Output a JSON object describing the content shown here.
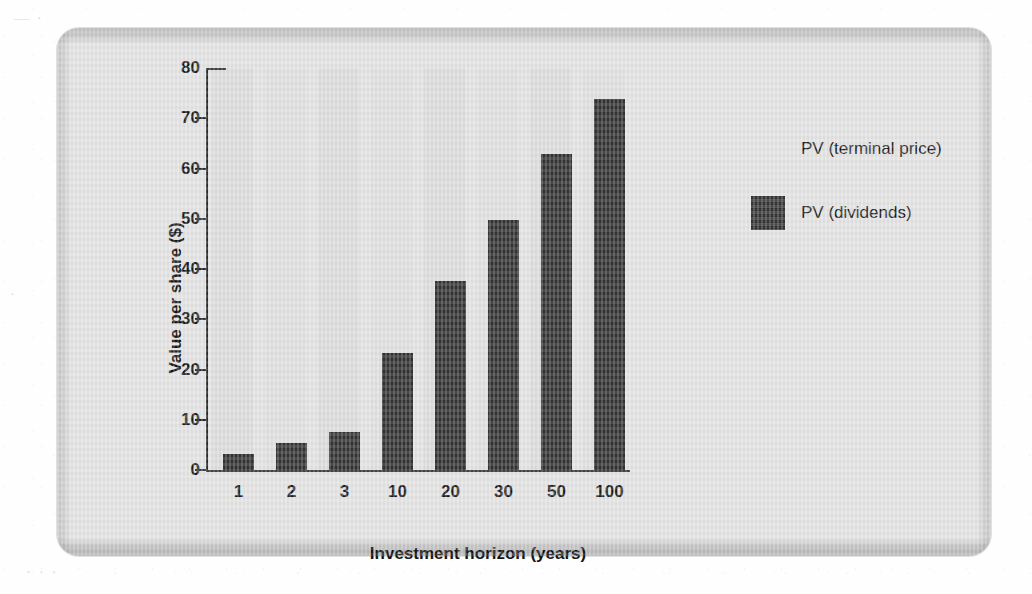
{
  "chart_data": {
    "type": "bar",
    "title": "",
    "xlabel": "Investment horizon (years)",
    "ylabel": "Value per share ($)",
    "categories": [
      "1",
      "2",
      "3",
      "10",
      "20",
      "30",
      "50",
      "100"
    ],
    "values": [
      3.2,
      5.4,
      7.6,
      23.3,
      37.6,
      49.7,
      62.8,
      73.8
    ],
    "series": [
      {
        "name": "PV (dividends)",
        "color": "#343434",
        "values": [
          3.2,
          5.4,
          7.6,
          23.3,
          37.6,
          49.7,
          62.8,
          73.8
        ]
      },
      {
        "name": "PV (terminal price)",
        "color": "#e2e2e2",
        "values": [
          76.8,
          74.6,
          72.4,
          56.7,
          42.4,
          30.3,
          17.2,
          6.2
        ]
      }
    ],
    "ylim": [
      0,
      80
    ],
    "yticks": [
      0,
      10,
      20,
      30,
      40,
      50,
      60,
      70,
      80
    ],
    "ytick_labels": [
      "0",
      "10",
      "20",
      "30",
      "40",
      "50",
      "60",
      "70",
      "80"
    ],
    "xtick_labels": [
      "1",
      "2",
      "3",
      "10",
      "20",
      "30",
      "50",
      "100"
    ],
    "grid": false,
    "legend": {
      "position": "right",
      "entries": [
        {
          "label": "PV (terminal price)",
          "swatch": "light",
          "color": "#e2e2e2"
        },
        {
          "label": "PV (dividends)",
          "swatch": "dark",
          "color": "#343434"
        }
      ]
    },
    "stacked": true,
    "bar_color": "#343434",
    "panel_color": "#e2e2e2"
  },
  "ghost_marks": [
    {
      "text": "—  ·",
      "left": 18,
      "top": 14
    },
    {
      "text": "·",
      "left": 14,
      "top": 288
    },
    {
      "text": "·   ·  ·",
      "left": 30,
      "top": 566
    },
    {
      "text": "·",
      "left": 1002,
      "top": 300
    }
  ]
}
